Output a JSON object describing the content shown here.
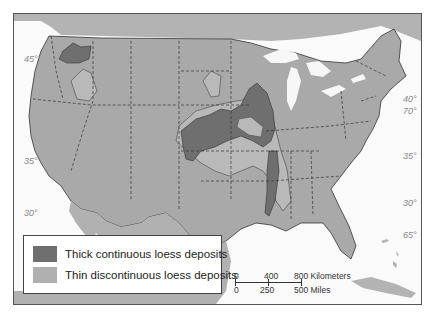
{
  "map": {
    "title": "Loess deposits of the United States",
    "colors": {
      "land": "#a9a9a9",
      "water": "#f7f7f7",
      "thick_loess": "#6f6f6f",
      "thin_loess": "#b9b9b9",
      "border": "#333333"
    },
    "latitude_labels": {
      "west": [
        "45°",
        "35°",
        "30°"
      ],
      "east": [
        "40°",
        "70°",
        "35°",
        "30°",
        "65°"
      ]
    }
  },
  "legend": {
    "items": [
      {
        "label": "Thick continuous loess deposits",
        "color": "#6f6f6f"
      },
      {
        "label": "Thin discontinuous loess deposits",
        "color": "#b0b0b0"
      }
    ]
  },
  "scale_bar": {
    "km_ticks": [
      "0",
      "400",
      "800 Kilometers"
    ],
    "mile_ticks": [
      "0",
      "250",
      "500 Miles"
    ]
  }
}
